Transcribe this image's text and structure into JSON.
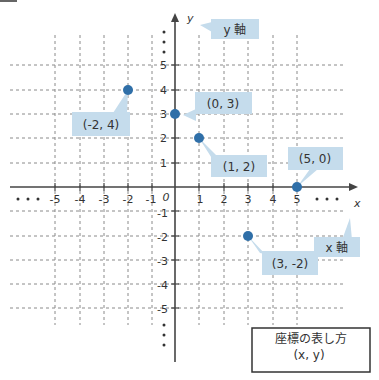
{
  "diagram": {
    "type": "coordinate-plane",
    "origin_label": "0",
    "x_axis": {
      "label": "x",
      "callout": "x 軸",
      "ticks": [
        "-5",
        "-4",
        "-3",
        "-2",
        "-1",
        "1",
        "2",
        "3",
        "4",
        "5"
      ],
      "ellipsis": "• • •"
    },
    "y_axis": {
      "label": "y",
      "callout": "y 軸",
      "ticks": [
        "5",
        "4",
        "3",
        "2",
        "1",
        "-1",
        "-2",
        "-3",
        "-4",
        "-5"
      ],
      "ellipsis": "⋮"
    },
    "points": [
      {
        "x": -2,
        "y": 4,
        "label": "(-2, 4)"
      },
      {
        "x": 0,
        "y": 3,
        "label": "(0, 3)"
      },
      {
        "x": 1,
        "y": 2,
        "label": "(1, 2)"
      },
      {
        "x": 5,
        "y": 0,
        "label": "(5, 0)"
      },
      {
        "x": 3,
        "y": -2,
        "label": "(3, -2)"
      }
    ],
    "legend_box": {
      "title": "座標の表し方",
      "formula": "(x, y)"
    },
    "colors": {
      "point": "#2f6fa8",
      "callout": "#c5dcec",
      "axis": "#444444",
      "grid": "#888888"
    }
  }
}
